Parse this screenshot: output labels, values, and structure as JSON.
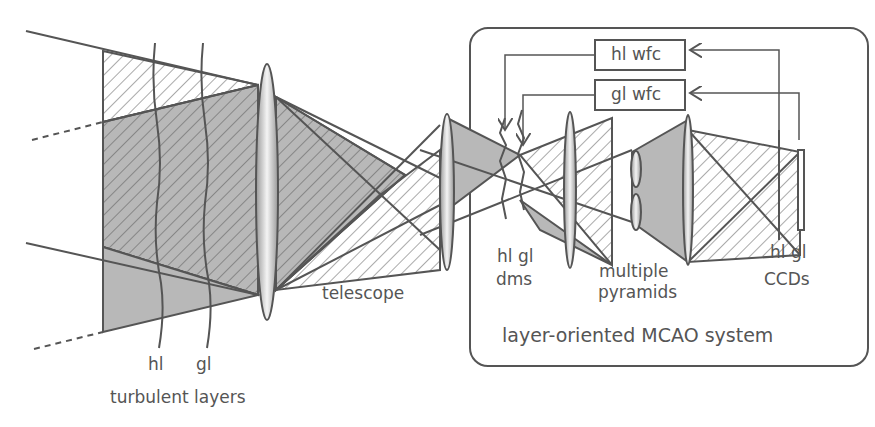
{
  "diagram": {
    "labels": {
      "hl_layer": "hl",
      "gl_layer": "gl",
      "turbulent_layers": "turbulent layers",
      "telescope": "telescope",
      "dms_hl_gl": "hl gl",
      "dms": "dms",
      "pyramids_1": "multiple",
      "pyramids_2": "pyramids",
      "ccds_hl_gl": "hl gl",
      "ccds": "CCDs",
      "hl_wfc": "hl wfc",
      "gl_wfc": "gl wfc",
      "system": "layer-oriented MCAO system"
    },
    "colors": {
      "line": "#555555",
      "fill": "#b8b8b8",
      "text": "#555555"
    }
  }
}
